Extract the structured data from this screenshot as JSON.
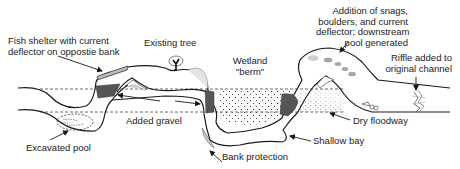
{
  "diagram": {
    "type": "stream restoration plan view",
    "colors": {
      "stroke": "#1a1a1a",
      "fill_dark": "#555555",
      "fill_light": "#bdbdbd",
      "dashed": "#444444",
      "text": "#222222"
    },
    "labels": {
      "fish_shelter": {
        "lines": [
          "Fish shelter with current",
          "deflector on oppostie bank"
        ]
      },
      "existing_tree": {
        "lines": [
          "Existing tree"
        ]
      },
      "wetland_berm": {
        "lines": [
          "Wetland",
          "\"berm\""
        ]
      },
      "snags_boulders": {
        "lines": [
          "Addition of snags,",
          "boulders, and current",
          "deflector; downstream",
          "pool generated"
        ]
      },
      "riffle": {
        "lines": [
          "Riffle added to",
          "original channel"
        ]
      },
      "added_gravel": {
        "lines": [
          "Added gravel"
        ]
      },
      "excavated_pool": {
        "lines": [
          "Excavated pool"
        ]
      },
      "bank_protection": {
        "lines": [
          "Bank protection"
        ]
      },
      "shallow_bay": {
        "lines": [
          "Shallow bay"
        ]
      },
      "dry_floodway": {
        "lines": [
          "Dry floodway"
        ]
      }
    }
  }
}
